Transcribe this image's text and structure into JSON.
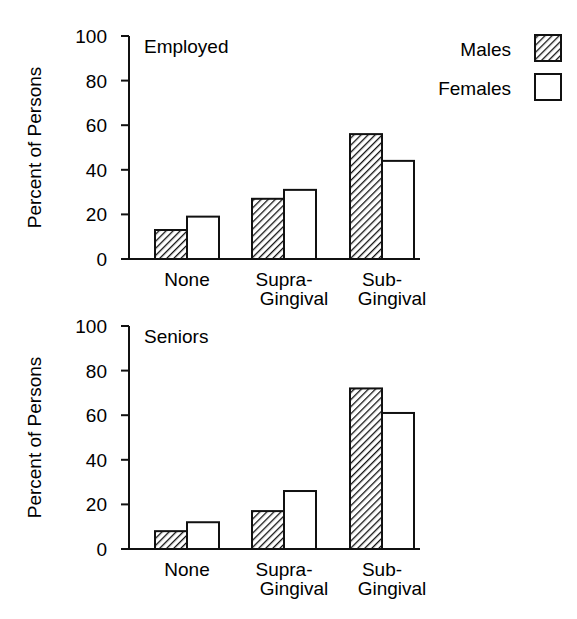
{
  "chart_data": [
    {
      "type": "bar",
      "title": "Employed",
      "xlabel": "",
      "ylabel": "Percent of Persons",
      "categories": [
        "None",
        "Supra-Gingival",
        "Sub-Gingival"
      ],
      "category_labels": [
        [
          "None"
        ],
        [
          "Supra-",
          "Gingival"
        ],
        [
          "Sub-",
          "Gingival"
        ]
      ],
      "series": [
        {
          "name": "Males",
          "values": [
            13,
            27,
            56
          ],
          "fill": "hatched"
        },
        {
          "name": "Females",
          "values": [
            19,
            31,
            44
          ],
          "fill": "white"
        }
      ],
      "ylim": [
        0,
        100
      ],
      "yticks": [
        0,
        20,
        40,
        60,
        80,
        100
      ],
      "grid": false,
      "legend_position": "top-right"
    },
    {
      "type": "bar",
      "title": "Seniors",
      "xlabel": "",
      "ylabel": "Percent of Persons",
      "categories": [
        "None",
        "Supra-Gingival",
        "Sub-Gingival"
      ],
      "category_labels": [
        [
          "None"
        ],
        [
          "Supra-",
          "Gingival"
        ],
        [
          "Sub-",
          "Gingival"
        ]
      ],
      "series": [
        {
          "name": "Males",
          "values": [
            8,
            17,
            72
          ],
          "fill": "hatched"
        },
        {
          "name": "Females",
          "values": [
            12,
            26,
            61
          ],
          "fill": "white"
        }
      ],
      "ylim": [
        0,
        100
      ],
      "yticks": [
        0,
        20,
        40,
        60,
        80,
        100
      ],
      "grid": false
    }
  ],
  "legend": {
    "items": [
      {
        "label": "Males",
        "fill": "hatched"
      },
      {
        "label": "Females",
        "fill": "white"
      }
    ]
  },
  "colors": {
    "ink": "#111111",
    "background": "#ffffff"
  }
}
